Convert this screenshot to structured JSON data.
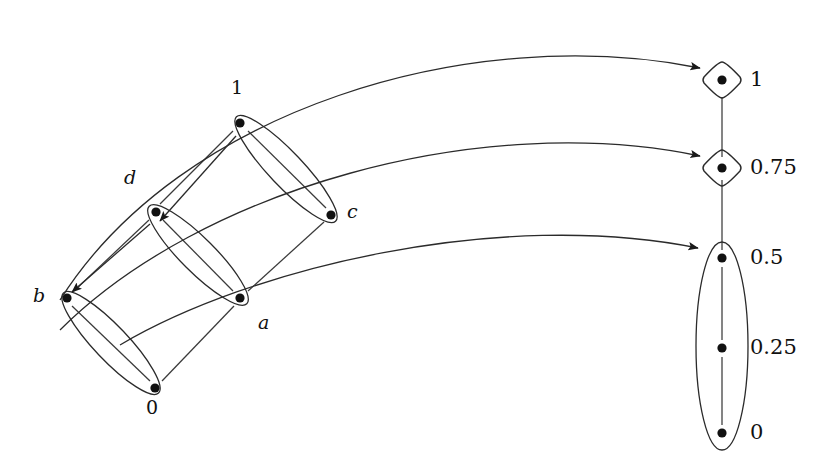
{
  "figure": {
    "type": "order-diagram",
    "stroke_color": "#1a1a1a",
    "node_color": "#111111",
    "background_color": "#ffffff"
  },
  "left_poset": {
    "name": "source-poset",
    "nodes": [
      {
        "id": "one",
        "label": "1",
        "style": "number",
        "x": 240,
        "y": 123,
        "label_x": 231,
        "label_y": 85
      },
      {
        "id": "d",
        "label": "d",
        "style": "italic",
        "x": 156,
        "y": 212,
        "label_x": 124,
        "label_y": 175
      },
      {
        "id": "c",
        "label": "c",
        "style": "italic",
        "x": 331,
        "y": 215,
        "label_x": 347,
        "label_y": 207
      },
      {
        "id": "b",
        "label": "b",
        "style": "italic",
        "x": 67,
        "y": 298,
        "label_x": 33,
        "label_y": 290
      },
      {
        "id": "a",
        "label": "a",
        "style": "italic",
        "x": 240,
        "y": 298,
        "label_x": 258,
        "label_y": 320
      },
      {
        "id": "zero",
        "label": "0",
        "style": "number",
        "x": 155,
        "y": 388,
        "label_x": 146,
        "label_y": 403
      }
    ],
    "blocks": [
      {
        "id": "block-1c",
        "members": [
          "one",
          "c"
        ]
      },
      {
        "id": "block-da",
        "members": [
          "d",
          "a"
        ]
      },
      {
        "id": "block-b0",
        "members": [
          "b",
          "zero"
        ]
      }
    ],
    "edges": [
      {
        "from": "d",
        "to": "one"
      },
      {
        "from": "c",
        "to": "one"
      },
      {
        "from": "b",
        "to": "d"
      },
      {
        "from": "a",
        "to": "d"
      },
      {
        "from": "a",
        "to": "c"
      },
      {
        "from": "zero",
        "to": "b"
      },
      {
        "from": "zero",
        "to": "a"
      }
    ]
  },
  "right_poset": {
    "name": "target-chain",
    "nodes": [
      {
        "id": "v1",
        "label": "1",
        "shape": "diamond",
        "x": 722,
        "y": 80,
        "label_x": 748,
        "label_y": 70
      },
      {
        "id": "v075",
        "label": "0.75",
        "shape": "diamond",
        "x": 722,
        "y": 168,
        "label_x": 748,
        "label_y": 158
      },
      {
        "id": "v05",
        "label": "0.5",
        "shape": "dot",
        "x": 722,
        "y": 258,
        "label_x": 748,
        "label_y": 248
      },
      {
        "id": "v025",
        "label": "0.25",
        "shape": "dot",
        "x": 722,
        "y": 348,
        "label_x": 748,
        "label_y": 338
      },
      {
        "id": "v0",
        "label": "0",
        "shape": "dot",
        "x": 722,
        "y": 433,
        "label_x": 748,
        "label_y": 423
      }
    ],
    "blocks": [
      {
        "id": "block-v05-v0",
        "members": [
          "v05",
          "v025",
          "v0"
        ]
      }
    ],
    "edges": [
      {
        "from": "v075",
        "to": "v1"
      },
      {
        "from": "v05",
        "to": "v075"
      },
      {
        "from": "v025",
        "to": "v05"
      },
      {
        "from": "v0",
        "to": "v025"
      }
    ]
  },
  "mapping_arrows": [
    {
      "id": "map-1-to-1",
      "from": "one",
      "to": "v1",
      "label": ""
    },
    {
      "id": "map-d-to-075",
      "from": "d",
      "to": "v075",
      "label": ""
    },
    {
      "id": "map-b-to-05",
      "from": "b",
      "to": "v05",
      "label": ""
    }
  ]
}
